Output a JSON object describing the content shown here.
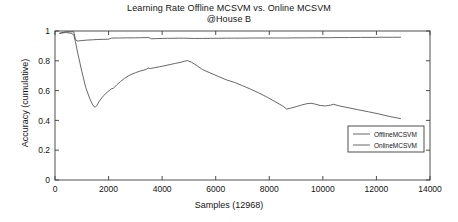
{
  "chart_data": {
    "type": "line",
    "title": "Learning Rate Offline MCSVM vs. Online MCSVM",
    "subtitle": "@House B",
    "xlabel": "Samples (12968)",
    "ylabel": "Accuracy (cumulative)",
    "xlim": [
      0,
      14000
    ],
    "ylim": [
      0,
      1
    ],
    "xticks": [
      0,
      2000,
      4000,
      6000,
      8000,
      10000,
      12000,
      14000
    ],
    "xticklabels": [
      "0",
      "2000",
      "4000",
      "6000",
      "8000",
      "10000",
      "12000",
      "14000"
    ],
    "yticks": [
      0,
      0.2,
      0.4,
      0.6,
      0.8,
      1
    ],
    "yticklabels": [
      "0",
      "0.2",
      "0.4",
      "0.6",
      "0.8",
      "1"
    ],
    "grid": false,
    "legend_position": "lower right",
    "line_color": "#4d4d4d",
    "axis_color": "#3c3c3c",
    "background": "#ffffff",
    "series": [
      {
        "name": "OfflineMCSVM",
        "x": [
          180,
          400,
          600,
          700,
          760,
          820,
          900,
          1000,
          1200,
          1400,
          1600,
          1800,
          2000,
          2100,
          2200,
          2400,
          2700,
          3000,
          3200,
          3400,
          3500,
          3600,
          3800,
          4000,
          4200,
          4400,
          4600,
          4800,
          5000,
          5200,
          5500,
          5800,
          6100,
          6400,
          6700,
          7000,
          7400,
          7800,
          8200,
          8600,
          9000,
          9400,
          9800,
          10200,
          10600,
          11000,
          11400,
          11800,
          12200,
          12600,
          12900
        ],
        "y": [
          0.985,
          0.995,
          0.995,
          0.995,
          0.945,
          0.932,
          0.934,
          0.936,
          0.939,
          0.941,
          0.943,
          0.944,
          0.945,
          0.952,
          0.953,
          0.953,
          0.954,
          0.954,
          0.955,
          0.956,
          0.956,
          0.948,
          0.949,
          0.95,
          0.951,
          0.951,
          0.952,
          0.952,
          0.951,
          0.95,
          0.95,
          0.951,
          0.951,
          0.952,
          0.952,
          0.952,
          0.953,
          0.953,
          0.953,
          0.953,
          0.954,
          0.954,
          0.955,
          0.955,
          0.956,
          0.956,
          0.957,
          0.957,
          0.958,
          0.958,
          0.958
        ]
      },
      {
        "name": "OnlineMCSVM",
        "x": [
          180,
          400,
          600,
          700,
          760,
          850,
          1000,
          1150,
          1300,
          1420,
          1500,
          1560,
          1650,
          1750,
          1850,
          1950,
          2050,
          2100,
          2180,
          2300,
          2450,
          2600,
          2800,
          3000,
          3200,
          3400,
          3480,
          3560,
          3700,
          3900,
          4100,
          4300,
          4500,
          4700,
          4850,
          4950,
          5100,
          5300,
          5500,
          5800,
          6100,
          6400,
          6700,
          7000,
          7300,
          7600,
          7900,
          8200,
          8500,
          8650,
          8800,
          9000,
          9200,
          9400,
          9550,
          9700,
          9900,
          10100,
          10300,
          10400,
          10600,
          10900,
          11300,
          11700,
          12100,
          12500,
          12900
        ],
        "y": [
          0.985,
          0.99,
          0.985,
          0.975,
          0.93,
          0.85,
          0.73,
          0.62,
          0.545,
          0.5,
          0.488,
          0.5,
          0.528,
          0.552,
          0.572,
          0.59,
          0.603,
          0.612,
          0.615,
          0.638,
          0.662,
          0.683,
          0.705,
          0.72,
          0.732,
          0.742,
          0.752,
          0.748,
          0.753,
          0.76,
          0.767,
          0.775,
          0.783,
          0.79,
          0.798,
          0.801,
          0.79,
          0.767,
          0.742,
          0.718,
          0.695,
          0.672,
          0.655,
          0.633,
          0.61,
          0.585,
          0.558,
          0.528,
          0.497,
          0.476,
          0.482,
          0.492,
          0.503,
          0.512,
          0.515,
          0.51,
          0.5,
          0.497,
          0.503,
          0.508,
          0.498,
          0.487,
          0.472,
          0.458,
          0.443,
          0.426,
          0.412
        ]
      }
    ]
  }
}
